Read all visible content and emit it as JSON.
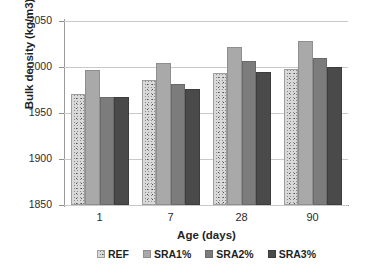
{
  "chart_data": {
    "type": "bar",
    "title": "",
    "xlabel": "Age (days)",
    "ylabel": "Bulk density (kg/m3)",
    "categories": [
      "1",
      "7",
      "28",
      "90"
    ],
    "series": [
      {
        "name": "REF",
        "values": [
          1971,
          1986,
          1993,
          1998
        ],
        "color": "#d9d9d9",
        "fill": "speckled-texture"
      },
      {
        "name": "SRA1%",
        "values": [
          1997,
          2004,
          2022,
          2028
        ],
        "color": "#a9a9a9",
        "fill": "solid"
      },
      {
        "name": "SRA2%",
        "values": [
          1967,
          1982,
          2006,
          2010
        ],
        "color": "#7c7c7c",
        "fill": "solid"
      },
      {
        "name": "SRA3%",
        "values": [
          1967,
          1976,
          1995,
          2000
        ],
        "color": "#4a4a4a",
        "fill": "solid"
      }
    ],
    "ylim": [
      1850,
      2050
    ],
    "ytick_labels": [
      "1850",
      "1900",
      "1950",
      "2000",
      "2050"
    ],
    "ytick_values": [
      1850,
      1900,
      1950,
      2000,
      2050
    ],
    "grid": true,
    "legend_position": "bottom"
  }
}
